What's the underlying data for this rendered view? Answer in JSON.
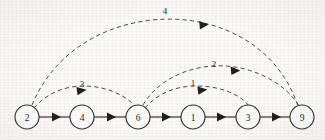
{
  "figure": {
    "width": 325,
    "height": 140,
    "background_color": "#fbfaf8",
    "ink_color": "#2b2b2b",
    "dashed_ink_color": "#4a4a4a"
  },
  "graph_data": {
    "type": "diagram",
    "layout": "horizontal-chain",
    "nodes": [
      {
        "id": "n2",
        "label": "2",
        "x": 27,
        "y": 117,
        "r": 12
      },
      {
        "id": "n4",
        "label": "4",
        "x": 82,
        "y": 117,
        "r": 12
      },
      {
        "id": "n6",
        "label": "6",
        "x": 138,
        "y": 117,
        "r": 12
      },
      {
        "id": "n1",
        "label": "1",
        "x": 193,
        "y": 117,
        "r": 12
      },
      {
        "id": "n3",
        "label": "3",
        "x": 248,
        "y": 117,
        "r": 12
      },
      {
        "id": "n9",
        "label": "9",
        "x": 302,
        "y": 117,
        "r": 12
      }
    ],
    "solid_edges": [
      {
        "id": "e-2-4",
        "from": "2",
        "to": "4",
        "label": "",
        "style": "solid",
        "arrow_x": 57,
        "arrow_y": 117
      },
      {
        "id": "e-4-6",
        "from": "4",
        "to": "6",
        "label": "",
        "style": "solid",
        "arrow_x": 112,
        "arrow_y": 117
      },
      {
        "id": "e-6-1",
        "from": "6",
        "to": "1",
        "label": "",
        "style": "solid",
        "arrow_x": 167,
        "arrow_y": 117
      },
      {
        "id": "e-1-3",
        "from": "1",
        "to": "3",
        "label": "",
        "style": "solid",
        "arrow_x": 222,
        "arrow_y": 117
      },
      {
        "id": "e-3-9",
        "from": "3",
        "to": "9",
        "label": "",
        "style": "solid",
        "arrow_x": 277,
        "arrow_y": 117
      }
    ],
    "dashed_edges": [
      {
        "id": "a-2-9",
        "from": "2",
        "to": "9",
        "label": "4",
        "style": "dashed",
        "label_x": 165,
        "label_y": 11,
        "arrow_x": 206,
        "arrow_y": 26
      },
      {
        "id": "a-2-6",
        "from": "2",
        "to": "6",
        "label": "3",
        "style": "dashed",
        "label_x": 82,
        "label_y": 84,
        "arrow_x": 84,
        "arrow_y": 96
      },
      {
        "id": "a-6-9",
        "from": "6",
        "to": "9",
        "label": "2",
        "style": "dashed",
        "label_x": 214,
        "label_y": 64,
        "arrow_x": 238,
        "arrow_y": 72
      },
      {
        "id": "a-6-3",
        "from": "6",
        "to": "3",
        "label": "1",
        "style": "dashed",
        "label_x": 193,
        "label_y": 83,
        "arrow_x": 205,
        "arrow_y": 93
      }
    ]
  }
}
